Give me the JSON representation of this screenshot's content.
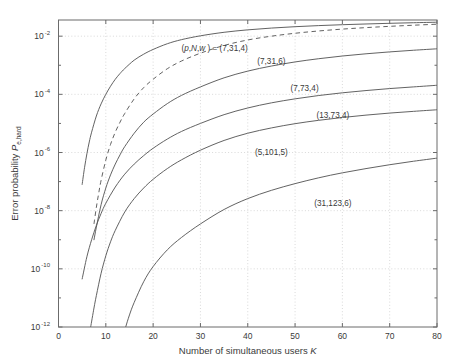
{
  "chart_data": {
    "type": "line",
    "title": "",
    "xlabel": "Number of simultaneous users   K",
    "xlabel_text": "Number of simultaneous users",
    "xlabel_symbol": "K",
    "ylabel": "Error probability  P_e,hard",
    "ylabel_text": "Error probability",
    "ylabel_symbol": "P",
    "ylabel_subscript": "e,hard",
    "yscale": "log",
    "xscale": "linear",
    "xlim": [
      0,
      80
    ],
    "ylim": [
      1e-12,
      0.036
    ],
    "grid": true,
    "legend_position": "inline-annotations",
    "xticks": [
      0,
      10,
      20,
      30,
      40,
      50,
      60,
      70,
      80
    ],
    "xtick_labels": [
      "0",
      "10",
      "20",
      "30",
      "40",
      "50",
      "60",
      "70",
      "80"
    ],
    "yticks": [
      0.01,
      0.0001,
      1e-06,
      1e-08,
      1e-10,
      1e-12
    ],
    "ytick_labels": [
      "10",
      "10",
      "10",
      "10",
      "10",
      "10"
    ],
    "ytick_exponents": [
      "-2",
      "-4",
      "-6",
      "-8",
      "-10",
      "-12"
    ],
    "annotation_prefix": "(p,N,w ) = ",
    "series": [
      {
        "name": "(7,31,4)",
        "label": "(7,31,4)",
        "style": "solid",
        "label_x": 33,
        "label_y": 0.003,
        "prefix": true,
        "x": [
          5,
          5.5,
          6,
          6.5,
          7,
          8,
          9,
          10,
          11,
          12,
          13,
          14,
          16,
          18,
          20,
          23,
          26,
          30,
          35,
          40,
          45,
          50,
          55,
          60,
          65,
          70,
          75,
          80
        ],
        "y": [
          8e-08,
          3e-07,
          9e-07,
          2.3e-06,
          5e-06,
          1.8e-05,
          4.7e-05,
          0.0001,
          0.00019,
          0.00033,
          0.00052,
          0.00077,
          0.0015,
          0.0024,
          0.0035,
          0.0055,
          0.0076,
          0.0103,
          0.0136,
          0.0165,
          0.019,
          0.0212,
          0.0231,
          0.0248,
          0.0263,
          0.0277,
          0.029,
          0.0302
        ]
      },
      {
        "name": "(7,31,6)",
        "label": "(7,31,6)",
        "style": "dashed",
        "label_x": 45,
        "label_y": 0.0011,
        "prefix": false,
        "x": [
          7.5,
          8,
          8.5,
          9,
          10,
          11,
          12,
          13,
          14,
          16,
          18,
          20,
          23,
          26,
          30,
          35,
          40,
          45,
          50,
          55,
          60,
          65,
          70,
          75,
          80
        ],
        "y": [
          3.5e-09,
          1.3e-08,
          4e-08,
          1.1e-07,
          5.5e-07,
          1.9e-06,
          5e-06,
          1.1e-05,
          2.2e-05,
          7e-05,
          0.00017,
          0.00033,
          0.00076,
          0.0014,
          0.0026,
          0.0048,
          0.0074,
          0.01,
          0.0126,
          0.0151,
          0.0175,
          0.0197,
          0.0218,
          0.0238,
          0.0258
        ]
      },
      {
        "name": "(7,73,4)",
        "label": "(7,73,4)",
        "style": "solid",
        "label_x": 52,
        "label_y": 0.00013,
        "prefix": false,
        "x": [
          7.5,
          8,
          9,
          10,
          11,
          12,
          13,
          14,
          16,
          18,
          20,
          23,
          26,
          30,
          35,
          40,
          45,
          50,
          55,
          60,
          65,
          70,
          75,
          80
        ],
        "y": [
          1e-09,
          2.7e-09,
          1.6e-08,
          6e-08,
          1.7e-07,
          4e-07,
          8.3e-07,
          1.6e-06,
          4.6e-06,
          1.1e-05,
          2.1e-05,
          4.8e-05,
          9.2e-05,
          0.00018,
          0.00037,
          0.00063,
          0.00094,
          0.0013,
          0.00168,
          0.00208,
          0.00248,
          0.00288,
          0.00328,
          0.00368
        ]
      },
      {
        "name": "(13,73,4)",
        "label": "(13,73,4)",
        "style": "solid",
        "label_x": 58,
        "label_y": 1.5e-05,
        "prefix": false,
        "x": [
          5,
          6,
          7,
          8,
          9,
          10,
          12,
          14,
          16,
          18,
          20,
          23,
          26,
          30,
          35,
          40,
          45,
          50,
          55,
          60,
          65,
          70,
          75,
          80
        ],
        "y": [
          4.5e-11,
          2.6e-10,
          1e-09,
          3.1e-09,
          8e-09,
          1.8e-08,
          6.5e-08,
          1.8e-07,
          4e-07,
          7.8e-07,
          1.4e-06,
          2.9e-06,
          5.3e-06,
          1e-05,
          2e-05,
          3.4e-05,
          5.1e-05,
          7e-05,
          9.1e-05,
          0.000113,
          0.000135,
          0.000158,
          0.00018,
          0.000205
        ]
      },
      {
        "name": "(5,101,5)",
        "label": "(5,101,5)",
        "style": "solid",
        "label_x": 45,
        "label_y": 8e-07,
        "prefix": false,
        "x": [
          6.8,
          7.5,
          8,
          9,
          10,
          11,
          12,
          14,
          16,
          18,
          20,
          23,
          26,
          30,
          35,
          40,
          45,
          50,
          55,
          60,
          65,
          70,
          75,
          80
        ],
        "y": [
          1e-12,
          4.5e-12,
          1.2e-11,
          7e-11,
          2.8e-10,
          8.5e-10,
          2.1e-09,
          9e-09,
          2.6e-08,
          6e-08,
          1.2e-07,
          2.8e-07,
          5.6e-07,
          1.2e-06,
          2.6e-06,
          4.6e-06,
          7e-06,
          9.8e-06,
          1.28e-05,
          1.6e-05,
          1.93e-05,
          2.27e-05,
          2.6e-05,
          2.95e-05
        ]
      },
      {
        "name": "(31,123,6)",
        "label": "(31,123,6)",
        "style": "solid",
        "label_x": 58,
        "label_y": 1.5e-08,
        "prefix": false,
        "x": [
          14.2,
          15,
          16,
          18,
          20,
          23,
          26,
          30,
          35,
          40,
          45,
          50,
          55,
          60,
          65,
          70,
          75,
          80
        ],
        "y": [
          1e-12,
          2.6e-12,
          7e-12,
          3.6e-11,
          1.2e-10,
          4.5e-10,
          1.2e-09,
          3.5e-09,
          1.1e-08,
          2.6e-08,
          5e-08,
          8.5e-08,
          1.35e-07,
          2e-07,
          2.8e-07,
          3.8e-07,
          5e-07,
          6.4e-07
        ]
      }
    ]
  },
  "colors": {
    "axis": "#6b6b6b",
    "grid": "#c8c8c8",
    "curve": "#5a5a5a",
    "text": "#3a3a3a",
    "background": "#ffffff"
  }
}
